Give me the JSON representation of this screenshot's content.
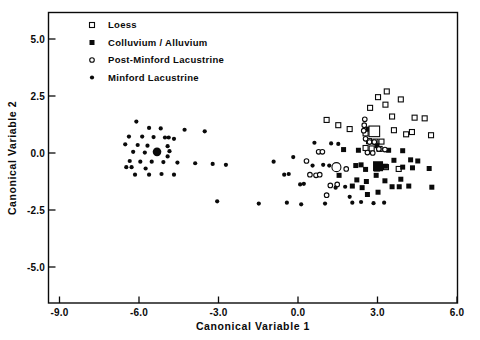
{
  "chart_data": {
    "type": "scatter",
    "title": "",
    "xlabel": "Canonical  Variable  1",
    "ylabel": "Canonical  Variable  2",
    "xlim": [
      -9.0,
      6.6
    ],
    "ylim": [
      -6.6,
      6.0
    ],
    "xticks": [
      -9.0,
      -6.0,
      -3.0,
      0.0,
      3.0,
      6.0
    ],
    "yticks": [
      5.0,
      2.5,
      0.0,
      -2.5,
      -5.0
    ],
    "xtick_labels": [
      "-9.0",
      "-6.0",
      "-3.0",
      "0.0",
      "3.0",
      "6.0"
    ],
    "ytick_labels": [
      "5.0",
      "2.5",
      "0.0",
      "-2.5",
      "-5.0"
    ],
    "grid": false,
    "legend_position": "top-left",
    "marker_color": "#0a0a0a",
    "series": [
      {
        "name": "Loess",
        "marker": "open-square",
        "centroid": [
          2.88,
          0.95
        ],
        "points": [
          [
            3.35,
            2.7
          ],
          [
            3.02,
            2.45
          ],
          [
            3.88,
            2.35
          ],
          [
            3.3,
            2.12
          ],
          [
            2.72,
            1.98
          ],
          [
            4.4,
            1.55
          ],
          [
            4.78,
            1.52
          ],
          [
            3.55,
            1.6
          ],
          [
            1.08,
            1.45
          ],
          [
            1.52,
            1.22
          ],
          [
            1.95,
            1.05
          ],
          [
            3.62,
            1.0
          ],
          [
            4.08,
            0.82
          ],
          [
            5.02,
            0.78
          ],
          [
            2.55,
            0.86
          ],
          [
            2.68,
            0.52
          ],
          [
            2.92,
            0.5
          ],
          [
            3.15,
            0.5
          ],
          [
            2.78,
            0.2
          ],
          [
            3.08,
            0.18
          ],
          [
            2.55,
            0.22
          ],
          [
            3.32,
            -0.62
          ],
          [
            2.98,
            -0.68
          ],
          [
            3.8,
            -0.7
          ],
          [
            4.3,
            0.92
          ]
        ]
      },
      {
        "name": "Colluvium / Alluvium",
        "marker": "filled-square",
        "centroid": [
          3.02,
          -0.58
        ],
        "points": [
          [
            2.65,
            1.05
          ],
          [
            2.98,
            0.32
          ],
          [
            3.42,
            0.12
          ],
          [
            3.95,
            0.1
          ],
          [
            1.72,
            0.15
          ],
          [
            2.28,
            0.12
          ],
          [
            4.25,
            -0.3
          ],
          [
            3.62,
            -0.32
          ],
          [
            4.52,
            -0.35
          ],
          [
            2.38,
            -0.52
          ],
          [
            2.18,
            -0.55
          ],
          [
            2.55,
            -0.72
          ],
          [
            3.3,
            -0.58
          ],
          [
            3.95,
            -0.62
          ],
          [
            4.32,
            -0.65
          ],
          [
            4.95,
            -0.68
          ],
          [
            2.95,
            -0.98
          ],
          [
            2.22,
            -1.18
          ],
          [
            2.58,
            -1.25
          ],
          [
            3.28,
            -1.22
          ],
          [
            3.88,
            -1.15
          ],
          [
            2.05,
            -1.45
          ],
          [
            2.42,
            -1.52
          ],
          [
            3.55,
            -1.48
          ],
          [
            3.82,
            -1.48
          ],
          [
            4.18,
            -1.45
          ],
          [
            3.02,
            -1.72
          ],
          [
            2.62,
            -1.82
          ],
          [
            1.55,
            -0.98
          ],
          [
            5.05,
            -1.5
          ]
        ]
      },
      {
        "name": "Post-Minford  Lacustrine",
        "marker": "open-circle",
        "centroid": [
          1.45,
          -0.62
        ],
        "points": [
          [
            2.52,
            1.48
          ],
          [
            2.5,
            1.22
          ],
          [
            2.48,
            0.98
          ],
          [
            2.55,
            0.62
          ],
          [
            2.7,
            0.48
          ],
          [
            2.88,
            0.48
          ],
          [
            3.05,
            0.18
          ],
          [
            3.28,
            0.15
          ],
          [
            0.78,
            0.05
          ],
          [
            0.92,
            0.05
          ],
          [
            2.62,
            0.02
          ],
          [
            2.82,
            0.0
          ],
          [
            0.32,
            -0.35
          ],
          [
            0.45,
            -0.95
          ],
          [
            0.68,
            -0.98
          ],
          [
            0.82,
            -0.95
          ],
          [
            1.82,
            -0.7
          ],
          [
            1.22,
            -1.42
          ],
          [
            1.48,
            -1.38
          ],
          [
            1.08,
            -1.85
          ]
        ]
      },
      {
        "name": "Minford  Lacustrine",
        "marker": "filled-dot",
        "centroid": [
          -5.32,
          0.05
        ],
        "points": [
          [
            -6.1,
            1.38
          ],
          [
            -5.62,
            1.1
          ],
          [
            -5.18,
            1.08
          ],
          [
            -4.28,
            1.02
          ],
          [
            -3.52,
            0.95
          ],
          [
            -6.38,
            0.72
          ],
          [
            -5.88,
            0.72
          ],
          [
            -5.45,
            0.7
          ],
          [
            -5.02,
            0.68
          ],
          [
            -4.88,
            0.68
          ],
          [
            -4.68,
            0.62
          ],
          [
            -6.52,
            0.38
          ],
          [
            -6.05,
            0.35
          ],
          [
            -5.68,
            0.32
          ],
          [
            -4.92,
            0.3
          ],
          [
            -4.85,
            0.08
          ],
          [
            -6.22,
            0.05
          ],
          [
            -5.78,
            0.02
          ],
          [
            -4.92,
            -0.15
          ],
          [
            -6.35,
            -0.35
          ],
          [
            -5.95,
            -0.38
          ],
          [
            -5.52,
            -0.38
          ],
          [
            -5.08,
            -0.4
          ],
          [
            -4.55,
            -0.42
          ],
          [
            -3.88,
            -0.45
          ],
          [
            -3.22,
            -0.48
          ],
          [
            -2.72,
            -0.52
          ],
          [
            -6.48,
            -0.62
          ],
          [
            -6.28,
            -0.62
          ],
          [
            -5.75,
            -0.68
          ],
          [
            -6.15,
            -0.95
          ],
          [
            -5.62,
            -0.95
          ],
          [
            -5.15,
            -0.92
          ],
          [
            -4.68,
            -0.95
          ],
          [
            -3.05,
            -2.12
          ],
          [
            -1.48,
            -2.22
          ],
          [
            -0.92,
            -0.38
          ],
          [
            -0.52,
            -0.95
          ],
          [
            -0.35,
            -0.92
          ],
          [
            0.08,
            -1.38
          ],
          [
            0.22,
            -1.35
          ],
          [
            -0.18,
            -0.18
          ],
          [
            0.55,
            -0.55
          ],
          [
            0.95,
            -0.52
          ],
          [
            1.18,
            -0.55
          ],
          [
            1.42,
            -1.52
          ],
          [
            1.78,
            -1.48
          ],
          [
            2.05,
            -2.18
          ],
          [
            2.38,
            -2.15
          ],
          [
            1.02,
            -2.22
          ],
          [
            0.12,
            -2.25
          ],
          [
            -0.42,
            -2.18
          ],
          [
            1.25,
            0.42
          ],
          [
            1.52,
            0.4
          ],
          [
            0.62,
            0.45
          ],
          [
            1.95,
            -1.92
          ],
          [
            2.85,
            -2.2
          ],
          [
            3.25,
            -2.18
          ]
        ]
      }
    ]
  },
  "legend": {
    "items": [
      {
        "label": "Loess",
        "marker": "open-square"
      },
      {
        "label": "Colluvium  /  Alluvium",
        "marker": "filled-square"
      },
      {
        "label": "Post-Minford  Lacustrine",
        "marker": "open-circle"
      },
      {
        "label": "Minford  Lacustrine",
        "marker": "filled-dot"
      }
    ]
  }
}
